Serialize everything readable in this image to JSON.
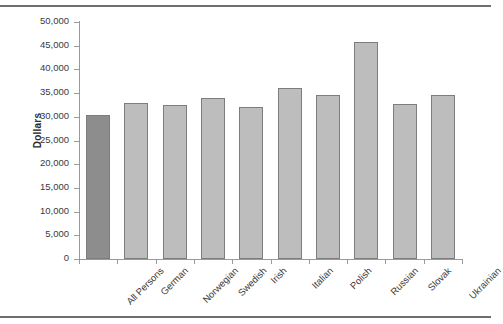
{
  "chart_data": {
    "type": "bar",
    "title": "",
    "xlabel": "",
    "ylabel": "Dollars",
    "ylim": [
      0,
      50000
    ],
    "ytick_interval": 5000,
    "grid": false,
    "legend": null,
    "categories": [
      "All Persons",
      "German",
      "Norwegian",
      "Swedish",
      "Irish",
      "Italian",
      "Polish",
      "Russian",
      "Slovak",
      "Ukrainian"
    ],
    "values": [
      30400,
      33000,
      32400,
      34000,
      32100,
      36000,
      34700,
      45800,
      32700,
      34500
    ],
    "ytick_labels": [
      "50,000",
      "45,000",
      "40,000",
      "35,000",
      "30,000",
      "25,000",
      "20,000",
      "15,000",
      "10,000",
      "5,000",
      "0"
    ],
    "ytick_values": [
      50000,
      45000,
      40000,
      35000,
      30000,
      25000,
      20000,
      15000,
      10000,
      5000,
      0
    ],
    "bar_colors": [
      "#8d8d8d",
      "#bdbdbd",
      "#bdbdbd",
      "#bdbdbd",
      "#bdbdbd",
      "#bdbdbd",
      "#bdbdbd",
      "#bdbdbd",
      "#bdbdbd",
      "#bdbdbd"
    ],
    "bar_border_color": "#7d7d7d",
    "axis_color": "#9a9a9a",
    "text_color": "#3a3a3a",
    "highlight_color": "#8d8d8d",
    "series_color": "#bdbdbd"
  }
}
